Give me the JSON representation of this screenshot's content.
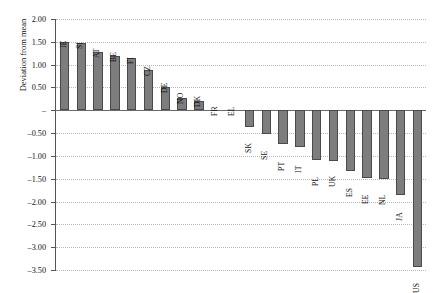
{
  "chart_data": {
    "type": "bar",
    "title": "",
    "xlabel": "",
    "ylabel": "Deviation from mean",
    "ylim": [
      -3.5,
      2.0
    ],
    "ytick_step": 0.5,
    "ytick_labels": [
      "2.00",
      "1.50",
      "1.00",
      "0.50",
      "–",
      "–0.50",
      "–1.00",
      "–1.50",
      "–2.00",
      "–2.50",
      "–3.00",
      "–3.50"
    ],
    "ytick_values": [
      2.0,
      1.5,
      1.0,
      0.5,
      0.0,
      -0.5,
      -1.0,
      -1.5,
      -2.0,
      -2.5,
      -3.0,
      -3.5
    ],
    "grid": true,
    "legend": "none",
    "orientation": "vertical",
    "bar_color": "#7d7d7d",
    "bar_edge_color": "#4a4a4a",
    "label_rotation": 90,
    "categories": [
      "IE",
      "SI",
      "AT",
      "BE",
      "FI",
      "CZ",
      "DE",
      "NO",
      "DK",
      "FR",
      "EL",
      "SK",
      "SE",
      "PT",
      "IT",
      "PL",
      "UK",
      "ES",
      "EE",
      "NL",
      "JA",
      "US"
    ],
    "values": [
      1.5,
      1.48,
      1.27,
      1.18,
      1.14,
      0.88,
      0.5,
      0.27,
      0.21,
      0.0,
      0.0,
      -0.36,
      -0.53,
      -0.75,
      -0.8,
      -1.09,
      -1.12,
      -1.32,
      -1.48,
      -1.5,
      -1.86,
      -3.43
    ]
  }
}
